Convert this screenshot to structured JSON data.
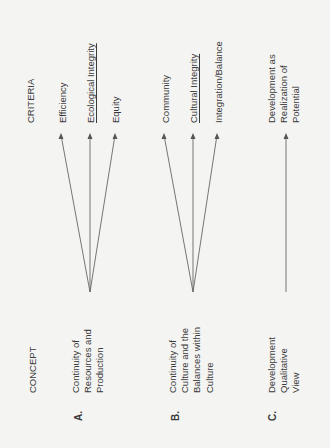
{
  "headers": {
    "concept": "CONCEPT",
    "criteria": "CRITERIA"
  },
  "concepts": [
    {
      "letter": "A.",
      "lines": [
        "Continuity of",
        "Resources and",
        "Production"
      ]
    },
    {
      "letter": "B.",
      "lines": [
        "Continuity of",
        "Culture and the",
        "Balances within",
        "Culture"
      ]
    },
    {
      "letter": "C.",
      "lines": [
        "Development",
        "Qualitative",
        "View"
      ]
    }
  ],
  "criteria": {
    "A": [
      "Efficiency",
      "Ecological Integrity",
      "Equity"
    ],
    "B": [
      "Community",
      "Cultural Integrity",
      "Integration/Balance"
    ],
    "C": [
      "Development as",
      "Realization of",
      "Potential"
    ]
  },
  "underlined": [
    "Ecological Integrity",
    "Cultural Integrity"
  ],
  "colors": {
    "line": "#555555",
    "text": "#3a3a3a",
    "background": "#f4f4f2"
  }
}
